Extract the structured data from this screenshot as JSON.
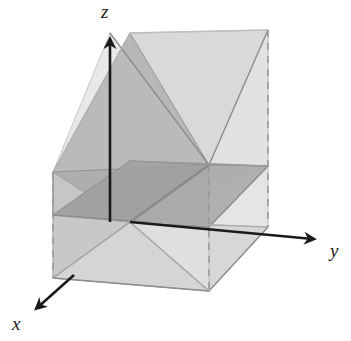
{
  "figure": {
    "background_color": "#ffffff",
    "width": 351,
    "height": 341
  },
  "axes": {
    "origin": {
      "x": 130,
      "y": 222
    },
    "color": "#1a1a1a",
    "stroke_width": 2.6,
    "items": [
      {
        "name": "z",
        "label": "z",
        "label_x": 101,
        "label_y": 2,
        "tip": {
          "x": 110,
          "y": 33
        },
        "direction": "up"
      },
      {
        "name": "y",
        "label": "y",
        "label_x": 330,
        "label_y": 241,
        "tip": {
          "x": 320,
          "y": 240
        },
        "direction": "right-down"
      },
      {
        "name": "x",
        "label": "x",
        "label_x": 12,
        "label_y": 314,
        "tip": {
          "x": 33,
          "y": 313
        },
        "direction": "left-down"
      }
    ]
  },
  "colors": {
    "lightest": "#f1f1f1",
    "light": "#e2e2e2",
    "light_mid": "#d3d3d3",
    "mid": "#c2c2c2",
    "mid_dark": "#b0b0b0",
    "dark": "#9e9e9e",
    "darkest": "#949494",
    "edge": "#8d8d8d",
    "edge_soft": "#b5b5b5",
    "dashed": "#9a9a9a",
    "axis": "#1a1a1a"
  },
  "dashed_edges": [
    {
      "name": "back-left-vertical",
      "x1": 53,
      "y1": 172,
      "x2": 53,
      "y2": 278
    },
    {
      "name": "front-middle-vertical",
      "x1": 209,
      "y1": 165,
      "x2": 209,
      "y2": 291
    },
    {
      "name": "back-right-vertical",
      "x1": 268,
      "y1": 30,
      "x2": 268,
      "y2": 227
    }
  ],
  "planes": [
    {
      "name": "bottom-floor-plane",
      "tone": "lightest",
      "points": "53,278 130,222 268,227 209,291"
    },
    {
      "name": "mid-horizontal-plane",
      "tone": "mid",
      "points": "53,215 130,161 268,166 209,227"
    },
    {
      "name": "rear-diagonal-plane",
      "tone": "light_mid",
      "points": "53,172 130,33 268,30 209,165"
    },
    {
      "name": "front-diagonal-plane-left",
      "tone": "dark",
      "points": "130,33 209,165 130,222 53,172"
    },
    {
      "name": "front-diagonal-plane-right",
      "tone": "mid_dark",
      "points": "268,30 268,227 130,222 209,165"
    },
    {
      "name": "x-section-upper-left-wing",
      "tone": "light",
      "points": "110,33 209,165 53,172"
    },
    {
      "name": "x-section-upper-right-wing",
      "tone": "light",
      "points": "268,30 209,165 268,166"
    },
    {
      "name": "x-section-lower-left-wing",
      "tone": "mid",
      "points": "53,278 130,222 209,291"
    },
    {
      "name": "x-section-lower-right-wing",
      "tone": "light_mid",
      "points": "268,227 130,222 209,291"
    }
  ],
  "edges": [
    {
      "name": "top-rear-ridge-left",
      "x1": 110,
      "y1": 33,
      "x2": 209,
      "y2": 165
    },
    {
      "name": "top-rear-ridge-right",
      "x1": 268,
      "y1": 30,
      "x2": 209,
      "y2": 165
    },
    {
      "name": "spine-vertical",
      "x1": 209,
      "y1": 165,
      "x2": 130,
      "y2": 222
    },
    {
      "name": "mid-plane-front-left",
      "x1": 53,
      "y1": 215,
      "x2": 209,
      "y2": 227
    },
    {
      "name": "mid-plane-front-right",
      "x1": 209,
      "y1": 227,
      "x2": 268,
      "y2": 166
    },
    {
      "name": "floor-front-left",
      "x1": 53,
      "y1": 278,
      "x2": 209,
      "y2": 291
    },
    {
      "name": "floor-front-right",
      "x1": 209,
      "y1": 291,
      "x2": 268,
      "y2": 227
    }
  ]
}
